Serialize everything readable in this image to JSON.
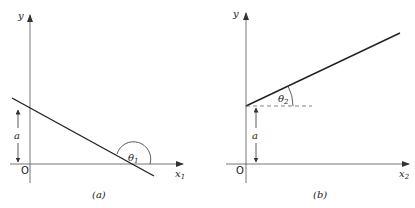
{
  "figures": [
    {
      "id": "a",
      "caption": "(a)",
      "y_axis_label": "y",
      "x_axis_label": "x",
      "x_axis_subscript": "1",
      "origin_label": "O",
      "intercept_label": "a",
      "angle_label": "θ",
      "angle_subscript": "1",
      "line_description": "negative slope line crossing y-axis at height a, obtuse angle θ1 with x-axis"
    },
    {
      "id": "b",
      "caption": "(b)",
      "y_axis_label": "y",
      "x_axis_label": "x",
      "x_axis_subscript": "2",
      "origin_label": "O",
      "intercept_label": "a",
      "angle_label": "θ",
      "angle_subscript": "2",
      "line_description": "positive slope line starting at y-axis height a, acute angle θ2 with horizontal dashed reference"
    }
  ],
  "colors": {
    "axis": "#555555",
    "line": "#222222",
    "text": "#222222"
  }
}
